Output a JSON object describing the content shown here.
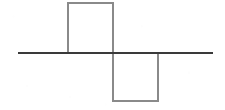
{
  "figure": {
    "kind": "square-wave-diagram",
    "width": 225,
    "height": 110,
    "background_color": "#ffffff",
    "caption": ""
  },
  "colors": {
    "axis_line": "#3a3a3a",
    "pulse_outline": "#8a8a8a",
    "background": "#ffffff"
  },
  "axis": {
    "label": "",
    "x_start": 18,
    "x_end": 213,
    "y": 53,
    "stroke_width": 2.2
  },
  "chart_data": {
    "type": "line",
    "title": "",
    "subtitle": "",
    "xlabel": "",
    "ylabel": "",
    "xlim": [
      18,
      213
    ],
    "ylim": [
      -1,
      1
    ],
    "grid": false,
    "legend": null,
    "annotations": [],
    "x": [
      18,
      68,
      68,
      113,
      113,
      158,
      158,
      213
    ],
    "y": [
      0,
      0,
      1,
      1,
      -1,
      -1,
      0,
      0
    ],
    "series": [
      {
        "name": "square wave",
        "values": [
          0,
          0,
          1,
          1,
          -1,
          -1,
          0,
          0
        ]
      }
    ],
    "pulses": [
      {
        "name": "positive-pulse",
        "polarity": "positive",
        "amplitude": 1,
        "x_start": 68,
        "x_end": 113,
        "y_top": 3,
        "y_bottom": 53,
        "width": 45,
        "height": 50
      },
      {
        "name": "negative-pulse",
        "polarity": "negative",
        "amplitude": -1,
        "x_start": 113,
        "x_end": 158,
        "y_top": 53,
        "y_bottom": 101,
        "width": 45,
        "height": 48
      }
    ],
    "stroke_width": 1.5
  }
}
